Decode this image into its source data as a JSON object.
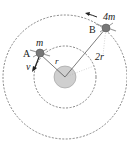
{
  "diagram": {
    "type": "orbital-satellites",
    "labels": {
      "satellite_a": "A",
      "mass_a": "m",
      "velocity_a": "v",
      "radius_inner": "r",
      "satellite_b": "B",
      "mass_b": "4m",
      "radius_outer": "2r"
    },
    "colors": {
      "planet_fill": "#cfcfcf",
      "orbit_stroke": "#666666",
      "line_stroke": "#444444",
      "satellite_fill": "#777777"
    }
  }
}
